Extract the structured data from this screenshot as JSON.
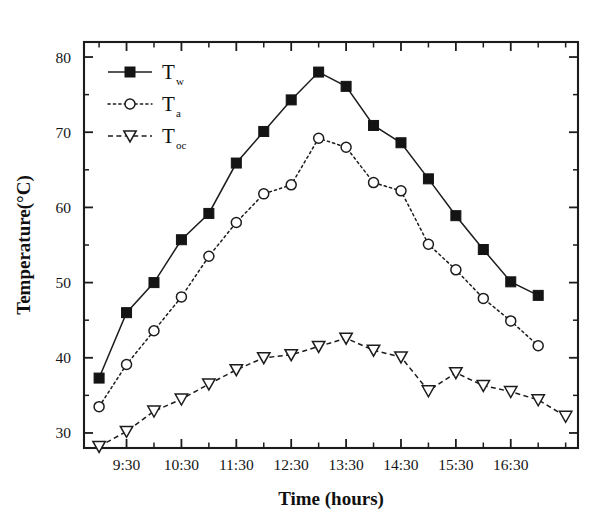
{
  "chart_data": {
    "type": "line",
    "title": "",
    "xlabel": "Time (hours)",
    "ylabel": "Temperature(°C)",
    "ylim": [
      28,
      82
    ],
    "xlim": [
      0,
      17
    ],
    "grid": false,
    "legend_position": "top-left",
    "y_ticks": [
      30,
      40,
      50,
      60,
      70,
      80
    ],
    "y_minor_ticks": [
      35,
      45,
      55,
      65,
      75
    ],
    "x_tick_labels": [
      "9:30",
      "10:30",
      "11:30",
      "12:30",
      "13:30",
      "14:30",
      "15:30",
      "16:30"
    ],
    "x_categories": [
      "9:00",
      "9:30",
      "10:00",
      "10:30",
      "11:00",
      "11:30",
      "12:00",
      "12:30",
      "13:00",
      "13:30",
      "14:00",
      "14:30",
      "15:00",
      "15:30",
      "16:00",
      "16:30",
      "17:00"
    ],
    "series": [
      {
        "name": "Tw",
        "label": "T",
        "subscript": "w",
        "marker": "filled-square",
        "linestyle": "solid",
        "color": "#141414",
        "values": [
          37.3,
          46.0,
          50.0,
          55.7,
          59.2,
          65.9,
          70.1,
          74.3,
          78.0,
          76.1,
          70.9,
          68.6,
          63.8,
          58.9,
          54.4,
          50.1,
          48.3
        ]
      },
      {
        "name": "Ta",
        "label": "T",
        "subscript": "a",
        "marker": "open-circle",
        "linestyle": "dotted",
        "color": "#1c1c1c",
        "values": [
          33.5,
          39.1,
          43.6,
          48.1,
          53.5,
          58.0,
          61.8,
          63.0,
          69.2,
          68.0,
          63.3,
          62.2,
          55.1,
          51.7,
          47.9,
          44.9,
          41.6
        ]
      },
      {
        "name": "Toc",
        "label": "T",
        "subscript": "oc",
        "marker": "open-triangle-down",
        "linestyle": "dashed",
        "color": "#1c1c1c",
        "values": [
          28.2,
          30.2,
          32.9,
          34.5,
          36.5,
          38.4,
          40.0,
          40.4,
          41.5,
          42.6,
          41.0,
          40.1,
          35.6,
          38.0,
          36.3,
          35.5,
          34.4,
          32.2
        ]
      }
    ]
  },
  "legend": {
    "entries": [
      {
        "label": "T",
        "subscript": "w"
      },
      {
        "label": "T",
        "subscript": "a"
      },
      {
        "label": "T",
        "subscript": "oc"
      }
    ]
  },
  "axes": {
    "y_title": "Temperature(°C)",
    "x_title": "Time (hours)"
  }
}
